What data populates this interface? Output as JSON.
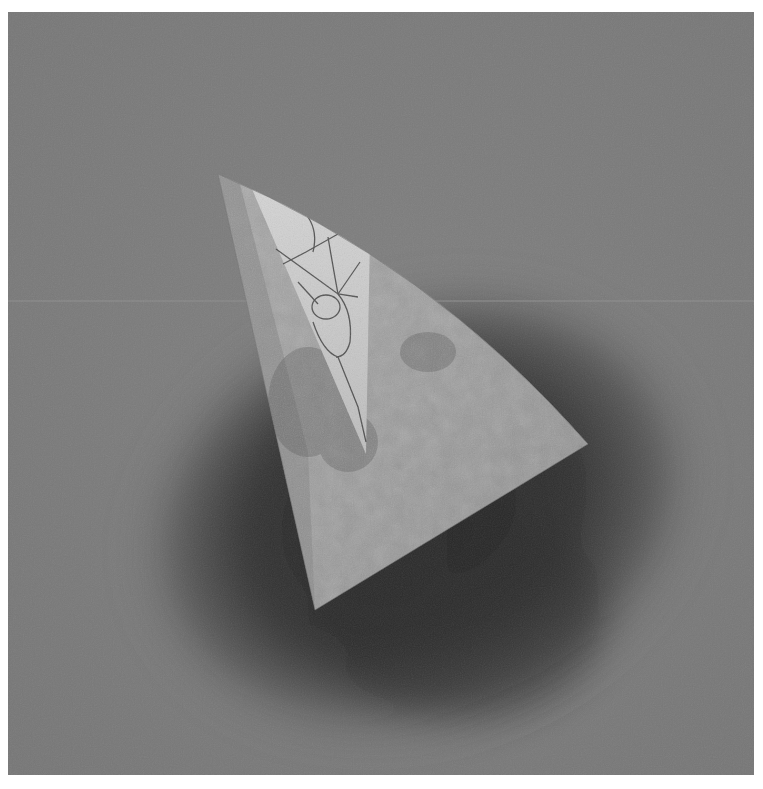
{
  "image": {
    "kind": "photograph",
    "subject": "tilted pale quarter-circle sector (fan/wedge shape) with a lighter inner triangular strip bearing a web-like crack pattern, floating over a dark circular shadow halo on a mottled grey canvas background",
    "colors": {
      "border": "#ffffff",
      "background": "#7b7b7b",
      "halo_dark": "#2e2e2e",
      "sector": "#9a9a9a",
      "inner_strip": "#c9c9c9",
      "crack_lines": "#3a3a3a"
    },
    "caption": "Grayscale photograph of a sector-shaped object with crackle pattern over dark halo"
  }
}
